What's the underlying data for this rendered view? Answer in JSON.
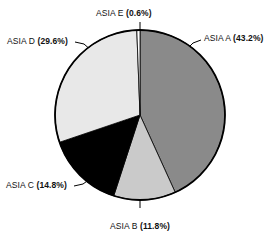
{
  "chart_data": {
    "type": "pie",
    "title": "",
    "subtitle": "",
    "xlabel": "",
    "ylabel": "",
    "legend_position": "none",
    "grid": false,
    "labels_show_percent": true,
    "start_angle_deg": 0,
    "direction": "clockwise",
    "categories": [
      "ASIA A",
      "ASIA B",
      "ASIA C",
      "ASIA D",
      "ASIA E"
    ],
    "values": [
      43.2,
      11.8,
      14.8,
      29.6,
      0.6
    ],
    "units": "%",
    "colors": [
      "#8a8a8a",
      "#cacaca",
      "#000000",
      "#e8e8e8",
      "#ffffff"
    ],
    "slices": [
      {
        "name": "ASIA A",
        "value": 43.2,
        "label": "ASIA A (43.2%)",
        "name_text": "ASIA A ",
        "percent_text": "(43.2%)",
        "color": "#8a8a8a"
      },
      {
        "name": "ASIA B",
        "value": 11.8,
        "label": "ASIA B (11.8%)",
        "name_text": "ASIA B ",
        "percent_text": "(11.8%)",
        "color": "#cacaca"
      },
      {
        "name": "ASIA C",
        "value": 14.8,
        "label": "ASIA C (14.8%)",
        "name_text": "ASIA C ",
        "percent_text": "(14.8%)",
        "color": "#000000"
      },
      {
        "name": "ASIA D",
        "value": 29.6,
        "label": "ASIA D (29.6%)",
        "name_text": "ASIA D ",
        "percent_text": "(29.6%)",
        "color": "#e8e8e8"
      },
      {
        "name": "ASIA E",
        "value": 0.6,
        "label": "ASIA E (0.6%)",
        "name_text": "ASIA E ",
        "percent_text": "(0.6%)",
        "color": "#ffffff"
      }
    ],
    "geometry": {
      "center_x": 140,
      "center_y": 115,
      "radius": 85,
      "outline_color": "#000000"
    }
  }
}
